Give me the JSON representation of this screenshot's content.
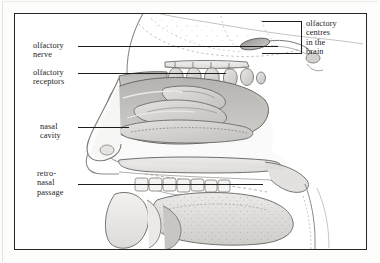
{
  "figure": {
    "style": "grayscale-pencil-anatomical-illustration",
    "frame_color": "#272727",
    "background_color": "#ffffff",
    "ink_color": "#1d1d1d"
  },
  "labels": {
    "olfactory_nerve": "olfactory\nnerve",
    "olfactory_receptors": "olfactory\nreceptors",
    "nasal_cavity": "nasal\ncavity",
    "retro_nasal_passage": "retro-\nnasal\npassage",
    "olfactory_centres": "olfactory\ncentres\nin the\nbrain"
  },
  "diagram_data": {
    "type": "anatomical-diagram",
    "title": "",
    "view": "mid-sagittal section, facing left",
    "annotations": [
      {
        "id": "olfactory-nerve",
        "label": "olfactory nerve",
        "label_position": "left",
        "leader": {
          "x1": 63,
          "y1": 32,
          "x2": 263,
          "y2": 32
        },
        "points_to": "olfactory nerve fibres passing through cribriform plate"
      },
      {
        "id": "olfactory-receptors",
        "label": "olfactory receptors",
        "label_position": "left",
        "leader": {
          "x1": 63,
          "y1": 59,
          "x2": 211,
          "y2": 59
        },
        "points_to": "olfactory epithelium on roof of nasal cavity"
      },
      {
        "id": "nasal-cavity",
        "label": "nasal cavity",
        "label_position": "left",
        "leader": {
          "x1": 63,
          "y1": 113,
          "x2": 114,
          "y2": 113
        },
        "points_to": "air space between nasal turbinates"
      },
      {
        "id": "retro-nasal-passage",
        "label": "retro-nasal passage",
        "label_position": "left",
        "leader": {
          "x1": 63,
          "y1": 170,
          "x2": 248,
          "y2": 170
        },
        "points_to": "passage from oral cavity up behind the soft palate"
      },
      {
        "id": "olfactory-centres",
        "label": "olfactory centres in the brain",
        "label_position": "right",
        "bracket": {
          "x": 247,
          "y": 7,
          "width": 40,
          "height": 33
        },
        "points_to": "olfactory bulb and tract at base of frontal lobe"
      }
    ],
    "structures": [
      "cranium / forehead profile",
      "frontal lobe of brain (stippled)",
      "olfactory bulb",
      "cribriform plate",
      "olfactory nerve bundles",
      "superior nasal turbinate",
      "middle nasal turbinate",
      "inferior nasal turbinate",
      "nasal cavity",
      "external nose profile",
      "hard palate",
      "soft palate",
      "retro-nasal passage",
      "upper teeth",
      "lower teeth",
      "tongue (stippled surface)",
      "mandible",
      "pharynx"
    ]
  }
}
